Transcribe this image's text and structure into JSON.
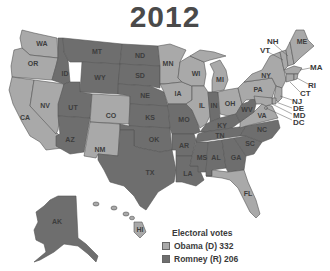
{
  "title": "2012",
  "colors": {
    "dem": "#a9a9a9",
    "rep": "#6e6e6e"
  },
  "legend": {
    "heading": "Electoral votes",
    "items": [
      {
        "label": "Obama (D) 332",
        "party": "dem"
      },
      {
        "label": "Romney (R) 206",
        "party": "rep"
      }
    ]
  },
  "states": {
    "WA": "dem",
    "OR": "dem",
    "CA": "dem",
    "NV": "dem",
    "CO": "dem",
    "NM": "dem",
    "MN": "dem",
    "IA": "dem",
    "WI": "dem",
    "IL": "dem",
    "MI": "dem",
    "OH": "dem",
    "PA": "dem",
    "NY": "dem",
    "VA": "dem",
    "FL": "dem",
    "ME": "dem",
    "NH": "dem",
    "VT": "dem",
    "MA": "dem",
    "RI": "dem",
    "CT": "dem",
    "NJ": "dem",
    "DE": "dem",
    "MD": "dem",
    "DC": "dem",
    "HI": "dem",
    "ID": "rep",
    "MT": "rep",
    "WY": "rep",
    "UT": "rep",
    "AZ": "rep",
    "ND": "rep",
    "SD": "rep",
    "NE": "rep",
    "KS": "rep",
    "OK": "rep",
    "TX": "rep",
    "MO": "rep",
    "AR": "rep",
    "LA": "rep",
    "MS": "rep",
    "AL": "rep",
    "GA": "rep",
    "TN": "rep",
    "KY": "rep",
    "IN": "rep",
    "WV": "rep",
    "NC": "rep",
    "SC": "rep",
    "AK": "rep"
  },
  "labels": {
    "WA": "WA",
    "OR": "OR",
    "CA": "CA",
    "NV": "NV",
    "ID": "ID",
    "MT": "MT",
    "WY": "WY",
    "UT": "UT",
    "CO": "CO",
    "AZ": "AZ",
    "NM": "NM",
    "ND": "ND",
    "SD": "SD",
    "NE": "NE",
    "KS": "KS",
    "OK": "OK",
    "TX": "TX",
    "MN": "MN",
    "IA": "IA",
    "MO": "MO",
    "AR": "AR",
    "LA": "LA",
    "WI": "WI",
    "IL": "IL",
    "MI": "MI",
    "IN": "IN",
    "OH": "OH",
    "KY": "KY",
    "TN": "TN",
    "MS": "MS",
    "AL": "AL",
    "GA": "GA",
    "FL": "FL",
    "SC": "SC",
    "NC": "NC",
    "VA": "VA",
    "WV": "WV",
    "PA": "PA",
    "NY": "NY",
    "ME": "ME",
    "NH": "NH",
    "VT": "VT",
    "MA": "MA",
    "RI": "RI",
    "CT": "CT",
    "NJ": "NJ",
    "DE": "DE",
    "MD": "MD",
    "DC": "DC",
    "AK": "AK",
    "HI": "HI"
  }
}
